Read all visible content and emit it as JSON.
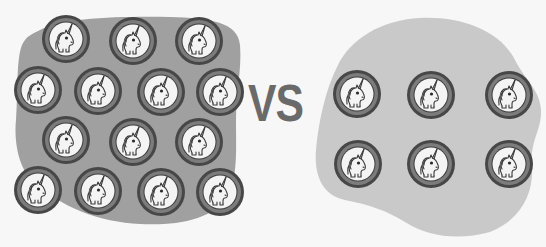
{
  "comparison": {
    "label": "VS"
  },
  "colors": {
    "background": "#f7f7f7",
    "left_blob": "#a0a0a0",
    "right_blob": "#c9c9c9",
    "coin_outer_ring": "#474747",
    "coin_mid_band": "#7c7c7c",
    "coin_face": "#f4f4f4",
    "icon_stroke": "#3a3a3a",
    "vs_text": "#6a6a6a"
  },
  "left_group": {
    "name": "dense-cluster",
    "coin_count": 14,
    "coin_icon": "unicorn-icon",
    "coins": [
      {
        "cx": 66,
        "cy": 39
      },
      {
        "cx": 133,
        "cy": 41
      },
      {
        "cx": 199,
        "cy": 41
      },
      {
        "cx": 38,
        "cy": 90
      },
      {
        "cx": 98,
        "cy": 91
      },
      {
        "cx": 161,
        "cy": 92
      },
      {
        "cx": 220,
        "cy": 92
      },
      {
        "cx": 66,
        "cy": 140
      },
      {
        "cx": 133,
        "cy": 142
      },
      {
        "cx": 199,
        "cy": 142
      },
      {
        "cx": 38,
        "cy": 190
      },
      {
        "cx": 98,
        "cy": 191
      },
      {
        "cx": 161,
        "cy": 192
      },
      {
        "cx": 220,
        "cy": 192
      }
    ]
  },
  "right_group": {
    "name": "sparse-cluster",
    "coin_count": 6,
    "coin_icon": "unicorn-icon",
    "coins": [
      {
        "cx": 357,
        "cy": 94
      },
      {
        "cx": 431,
        "cy": 95
      },
      {
        "cx": 509,
        "cy": 95
      },
      {
        "cx": 358,
        "cy": 164
      },
      {
        "cx": 431,
        "cy": 164
      },
      {
        "cx": 509,
        "cy": 164
      }
    ]
  },
  "coin": {
    "radius": 24
  }
}
